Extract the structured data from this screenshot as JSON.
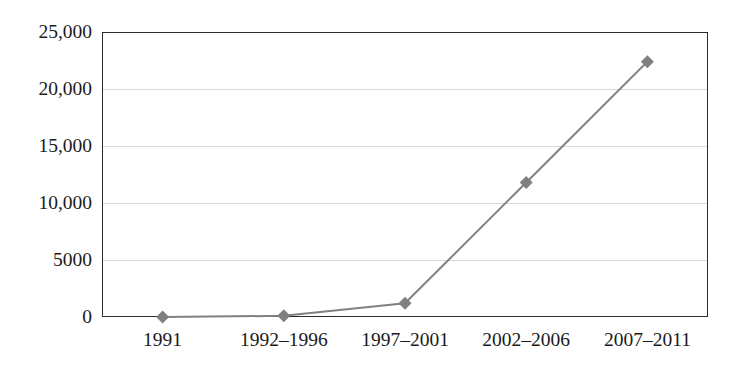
{
  "chart_data": {
    "type": "line",
    "title": "",
    "subtitle": "",
    "xlabel": "",
    "ylabel": "",
    "categories": [
      "1991",
      "1992–1996",
      "1997–2001",
      "2002–2006",
      "2007–2011"
    ],
    "values": [
      0,
      100,
      1200,
      11800,
      22400
    ],
    "series": [
      {
        "name": "",
        "values": [
          0,
          100,
          1200,
          11800,
          22400
        ]
      }
    ],
    "ylim": [
      0,
      25000
    ],
    "ytick_values": [
      0,
      5000,
      10000,
      15000,
      20000,
      25000
    ],
    "ytick_labels": [
      "0",
      "5000",
      "10,000",
      "15,000",
      "20,000",
      "25,000"
    ],
    "grid": true,
    "grid_axis": "y",
    "legend": false,
    "legend_position": "none",
    "annotations": [],
    "marker": "diamond",
    "line_color": "#808080",
    "marker_color": "#808080",
    "grid_color": "#d8d8d8",
    "axis_color": "#2b2b2b",
    "background_color": "#ffffff",
    "text_color": "#1a1a1a"
  }
}
